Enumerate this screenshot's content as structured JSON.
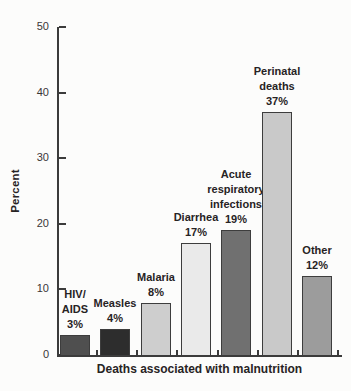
{
  "chart_data": {
    "type": "bar",
    "title": "",
    "xlabel": "Deaths associated with malnutrition",
    "ylabel": "Percent",
    "ylim": [
      0,
      50
    ],
    "yticks": [
      0,
      10,
      20,
      30,
      40,
      50
    ],
    "grid": false,
    "legend": null,
    "categories": [
      "HIV/AIDS",
      "Measles",
      "Malaria",
      "Diarrhea",
      "Acute respiratory infections",
      "Perinatal deaths",
      "Other"
    ],
    "values": [
      3,
      4,
      8,
      17,
      19,
      37,
      12
    ],
    "bars": [
      {
        "slug": "hiv-aids",
        "label_lines": [
          "HIV/",
          "AIDS",
          "3%"
        ],
        "value": 3,
        "color": "#4f4f4f"
      },
      {
        "slug": "measles",
        "label_lines": [
          "Measles",
          "4%"
        ],
        "value": 4,
        "color": "#2d2d2d"
      },
      {
        "slug": "malaria",
        "label_lines": [
          "Malaria",
          "8%"
        ],
        "value": 8,
        "color": "#cecece"
      },
      {
        "slug": "diarrhea",
        "label_lines": [
          "Diarrhea",
          "17%"
        ],
        "value": 17,
        "color": "#eaeaea"
      },
      {
        "slug": "acute-respiratory-infections",
        "label_lines": [
          "Acute",
          "respiratory",
          "infections",
          "19%"
        ],
        "value": 19,
        "color": "#707070"
      },
      {
        "slug": "perinatal-deaths",
        "label_lines": [
          "Perinatal",
          "deaths",
          "37%"
        ],
        "value": 37,
        "color": "#c9c9c9"
      },
      {
        "slug": "other",
        "label_lines": [
          "Other",
          "12%"
        ],
        "value": 12,
        "color": "#9c9c9c"
      }
    ]
  },
  "colors": {
    "axis": "#3b3b3b",
    "text": "#272324",
    "bar_border": "#3d3d3d",
    "background": "#fcfcfb"
  }
}
